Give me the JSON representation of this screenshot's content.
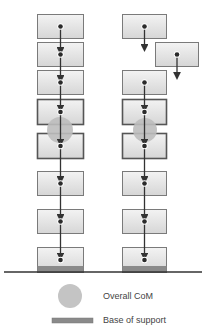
{
  "diagram": {
    "title": "",
    "colors": {
      "box_fill_top": "#f0f0f0",
      "box_fill_bottom": "#d8d8d8",
      "box_border": "#7a7a7a",
      "box_border_highlight": "#555555",
      "dot": "#2a2a2a",
      "arrow": "#333333",
      "com_circle": "#bdbdbd",
      "base": "#8a8a8a",
      "ground": "#333333"
    },
    "stacks": [
      {
        "name": "aligned-stack",
        "boxes": [
          {
            "x": 37,
            "y": 14,
            "w": 46,
            "h": 24
          },
          {
            "x": 37,
            "y": 42,
            "w": 46,
            "h": 24
          },
          {
            "x": 37,
            "y": 70,
            "w": 46,
            "h": 24
          },
          {
            "x": 37,
            "y": 99,
            "w": 46,
            "h": 25,
            "highlight": true
          },
          {
            "x": 37,
            "y": 133,
            "w": 46,
            "h": 25,
            "highlight": true
          },
          {
            "x": 37,
            "y": 171,
            "w": 46,
            "h": 24
          },
          {
            "x": 37,
            "y": 209,
            "w": 46,
            "h": 24
          },
          {
            "x": 37,
            "y": 247,
            "w": 46,
            "h": 25,
            "base": true
          }
        ],
        "com": {
          "cx": 60,
          "cy": 130,
          "r": 13
        }
      },
      {
        "name": "offset-stack",
        "boxes": [
          {
            "x": 122,
            "y": 14,
            "w": 44,
            "h": 24
          },
          {
            "x": 155,
            "y": 42,
            "w": 43,
            "h": 24
          },
          {
            "x": 122,
            "y": 70,
            "w": 44,
            "h": 24
          },
          {
            "x": 122,
            "y": 99,
            "w": 44,
            "h": 25,
            "highlight": true
          },
          {
            "x": 122,
            "y": 133,
            "w": 44,
            "h": 25,
            "highlight": true
          },
          {
            "x": 122,
            "y": 171,
            "w": 44,
            "h": 24
          },
          {
            "x": 122,
            "y": 209,
            "w": 44,
            "h": 24
          },
          {
            "x": 122,
            "y": 247,
            "w": 44,
            "h": 25,
            "base": true
          }
        ],
        "com": {
          "cx": 145,
          "cy": 130,
          "r": 12
        }
      }
    ],
    "ground": {
      "x1": 4,
      "x2": 202,
      "y": 272
    }
  },
  "legend": {
    "com_label": "Overall CoM",
    "base_label": "Base of support"
  }
}
